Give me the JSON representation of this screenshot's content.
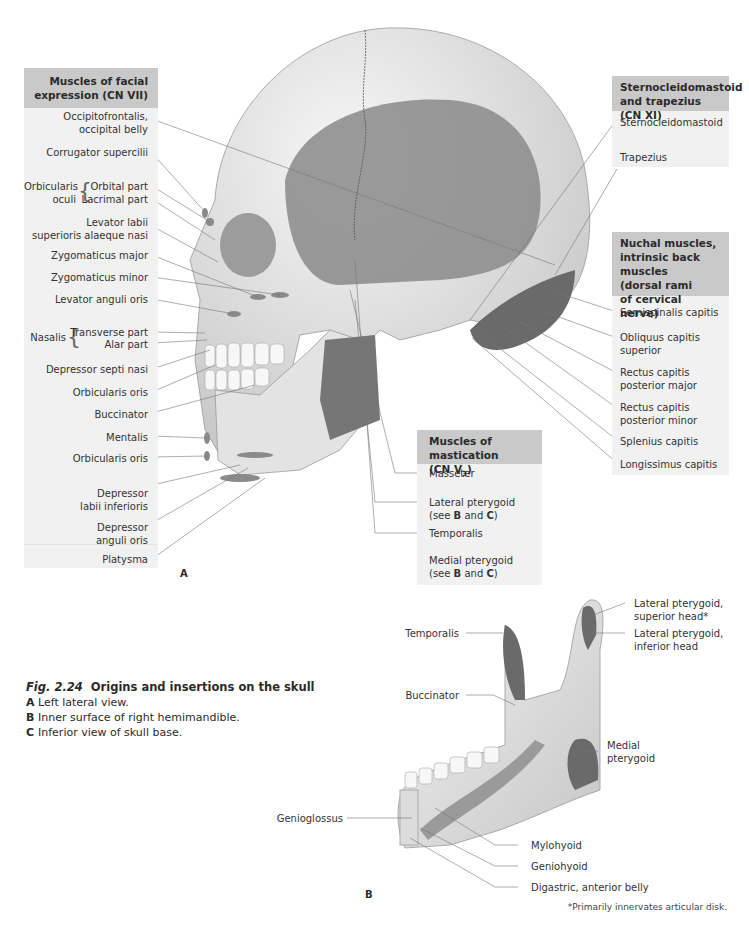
{
  "figure": {
    "number": "Fig. 2.24",
    "title": "Origins and insertions on the skull",
    "items": [
      {
        "letter": "A",
        "text": "Left lateral view."
      },
      {
        "letter": "B",
        "text": "Inner surface of right hemimandible."
      },
      {
        "letter": "C",
        "text": "Inferior view of skull base."
      }
    ],
    "footnote": "*Primarily innervates articular disk."
  },
  "panels": {
    "facial": {
      "header": "Muscles of facial expression (CN VII)",
      "labels": {
        "occipitofrontalis_1": "Occipitofrontalis,",
        "occipitofrontalis_2": "occipital belly",
        "corrugator": "Corrugator supercilii",
        "orbicularis_oculi_1": "Orbicularis",
        "orbicularis_oculi_2": "oculi",
        "orbital_part": "Orbital part",
        "lacrimal_part": "Lacrimal part",
        "levator_labii_1": "Levator labii",
        "levator_labii_2": "superioris alaeque nasi",
        "zyg_major": "Zygomaticus major",
        "zyg_minor": "Zygomaticus minor",
        "levator_anguli": "Levator anguli oris",
        "nasalis": "Nasalis",
        "transverse_part": "Transverse part",
        "alar_part": "Alar part",
        "depressor_septi": "Depressor septi nasi",
        "orbicularis_oris_1": "Orbicularis oris",
        "buccinator": "Buccinator",
        "mentalis": "Mentalis",
        "orbicularis_oris_2": "Orbicularis oris",
        "dep_labii_1": "Depressor",
        "dep_labii_2": "labii inferioris",
        "dep_anguli_1": "Depressor",
        "dep_anguli_2": "anguli oris",
        "platysma": "Platysma"
      }
    },
    "cn11": {
      "header_1": "Sternocleidomastoid",
      "header_2": "and trapezius (CN XI)",
      "labels": {
        "scm": "Sternocleidomastoid",
        "trapezius": "Trapezius"
      }
    },
    "nuchal": {
      "header_1": "Nuchal muscles,",
      "header_2": "intrinsic back muscles",
      "header_3": "(dorsal rami",
      "header_4": "of cervical nerve)",
      "labels": {
        "semispinalis": "Semispinalis capitis",
        "obliquus_1": "Obliquus capitis",
        "obliquus_2": "superior",
        "rcp_major_1": "Rectus capitis",
        "rcp_major_2": "posterior major",
        "rcp_minor_1": "Rectus capitis",
        "rcp_minor_2": "posterior minor",
        "splenius": "Splenius capitis",
        "longissimus": "Longissimus capitis"
      }
    },
    "mastication": {
      "header_1": "Muscles of mastication",
      "header_2": "(CN V",
      "header_sub": "3",
      "header_3": ")",
      "labels": {
        "masseter": "Masseter",
        "lat_pteryg_1": "Lateral pterygoid",
        "temporalis": "Temporalis",
        "med_pteryg_1": "Medial pterygoid",
        "see": "(see ",
        "and": " and ",
        "close": ")",
        "B": "B",
        "C": "C"
      }
    }
  },
  "view_b": {
    "labels": {
      "temporalis": "Temporalis",
      "lat_sup_1": "Lateral pterygoid,",
      "lat_sup_2": "superior head*",
      "lat_inf_1": "Lateral pterygoid,",
      "lat_inf_2": "inferior head",
      "buccinator": "Buccinator",
      "medial_1": "Medial",
      "medial_2": "pterygoid",
      "genioglossus": "Genioglossus",
      "mylohyoid": "Mylohyoid",
      "geniohyoid": "Geniohyoid",
      "digastric": "Digastric, anterior belly"
    }
  },
  "view_letters": {
    "a": "A",
    "b": "B"
  },
  "colors": {
    "panel_header": "#c9c9c9",
    "panel_body": "#f1f1f1",
    "bone": "#e6e6e6",
    "muscle": "#707070"
  }
}
